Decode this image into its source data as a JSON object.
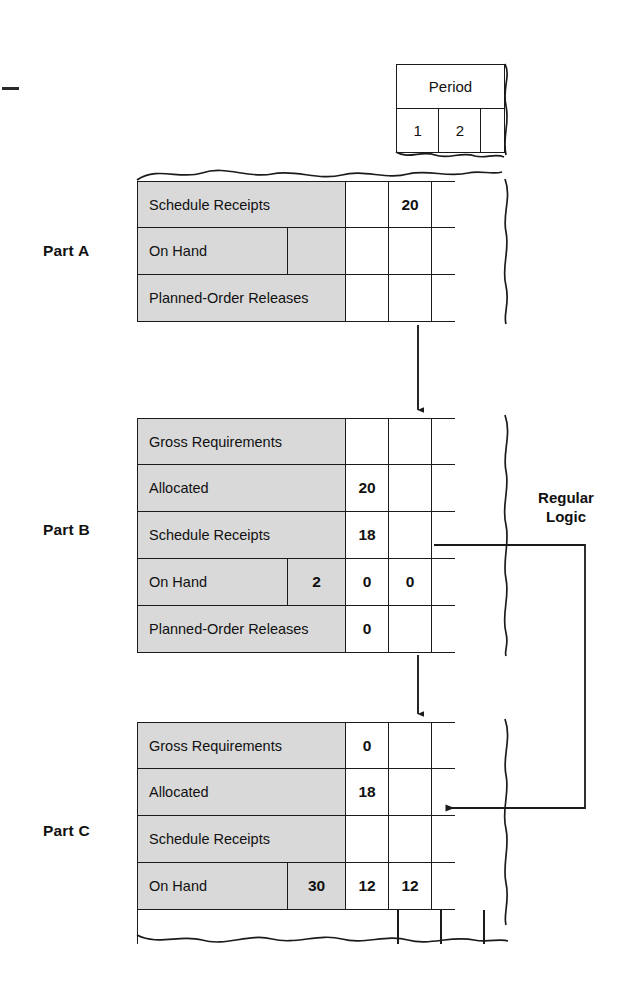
{
  "diagram": {
    "title_mark": "",
    "period_header": {
      "label": "Period",
      "columns": [
        "1",
        "2",
        ""
      ]
    },
    "logic_annotation": "Regular\nLogic",
    "parts": [
      {
        "name": "Part A",
        "rows": [
          {
            "label": "Schedule Receipts",
            "balance": "",
            "p1": "",
            "p2": "20",
            "p3": ""
          },
          {
            "label": "On Hand",
            "balance": "",
            "p1": "",
            "p2": "",
            "p3": "",
            "split": true
          },
          {
            "label": "Planned-Order Releases",
            "balance": "",
            "p1": "",
            "p2": "",
            "p3": ""
          }
        ],
        "torn_top": true,
        "torn_bottom": false
      },
      {
        "name": "Part B",
        "rows": [
          {
            "label": "Gross Requirements",
            "balance": "",
            "p1": "",
            "p2": "",
            "p3": ""
          },
          {
            "label": "Allocated",
            "balance": "",
            "p1": "20",
            "p2": "",
            "p3": ""
          },
          {
            "label": "Schedule Receipts",
            "balance": "",
            "p1": "18",
            "p2": "",
            "p3": ""
          },
          {
            "label": "On Hand",
            "balance": "2",
            "p1": "0",
            "p2": "0",
            "p3": "",
            "split": true
          },
          {
            "label": "Planned-Order Releases",
            "balance": "",
            "p1": "0",
            "p2": "",
            "p3": ""
          }
        ],
        "torn_top": false,
        "torn_bottom": false
      },
      {
        "name": "Part C",
        "rows": [
          {
            "label": "Gross Requirements",
            "balance": "",
            "p1": "0",
            "p2": "",
            "p3": ""
          },
          {
            "label": "Allocated",
            "balance": "",
            "p1": "18",
            "p2": "",
            "p3": ""
          },
          {
            "label": "Schedule Receipts",
            "balance": "",
            "p1": "",
            "p2": "",
            "p3": ""
          },
          {
            "label": "On Hand",
            "balance": "30",
            "p1": "12",
            "p2": "12",
            "p3": "",
            "split": true
          }
        ],
        "torn_top": false,
        "torn_bottom": true
      }
    ],
    "colors": {
      "line": "#1b1b1b",
      "label_fill": "#d9d9d9",
      "cell_fill": "#ffffff",
      "text": "#111111"
    }
  }
}
